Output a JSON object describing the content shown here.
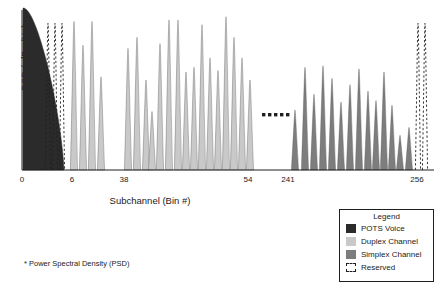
{
  "chart_data": {
    "type": "bar",
    "title": "",
    "xlabel": "Subchannel (Bin #)",
    "ylabel": "PSD ( dBm/Hz)",
    "footnote": "* Power Spectral Density (PSD)",
    "xlim": [
      0,
      270
    ],
    "ylim": [
      0,
      100
    ],
    "grid": false,
    "axis_ticks": [
      {
        "value": 0,
        "label": "0",
        "x": 22
      },
      {
        "value": 6,
        "label": "6",
        "x": 72
      },
      {
        "value": 38,
        "label": "38",
        "x": 124
      },
      {
        "value": 54,
        "label": "54",
        "x": 248
      },
      {
        "value": 241,
        "label": "241",
        "x": 288
      },
      {
        "value": 256,
        "label": "256",
        "x": 417
      }
    ],
    "break_marker": {
      "label": "......",
      "dots": 5,
      "x": 262,
      "y": 113
    },
    "series": [
      {
        "name": "POTS Voice",
        "color": "#2b2b2b",
        "type": "envelope",
        "x_start": 23,
        "x_end": 64,
        "peak_height": 100,
        "description": "Solid dark envelope decaying from left edge"
      },
      {
        "name": "Reserved (low band)",
        "color": "#ffffff",
        "edge": "#1f1f1f",
        "type": "dashed-peaks",
        "peaks": [
          {
            "x": 48,
            "height": 93
          },
          {
            "x": 55,
            "height": 93
          },
          {
            "x": 62,
            "height": 93
          }
        ]
      },
      {
        "name": "Duplex Channel",
        "color": "#c9c9c9",
        "type": "peaks",
        "peaks": [
          {
            "x": 74,
            "height": 94
          },
          {
            "x": 83,
            "height": 79
          },
          {
            "x": 92,
            "height": 94
          },
          {
            "x": 101,
            "height": 59
          },
          {
            "x": 128,
            "height": 77
          },
          {
            "x": 137,
            "height": 84
          },
          {
            "x": 146,
            "height": 57
          },
          {
            "x": 152,
            "height": 37
          },
          {
            "x": 160,
            "height": 80
          },
          {
            "x": 169,
            "height": 95
          },
          {
            "x": 178,
            "height": 95
          },
          {
            "x": 186,
            "height": 62
          },
          {
            "x": 194,
            "height": 65
          },
          {
            "x": 202,
            "height": 92
          },
          {
            "x": 210,
            "height": 71
          },
          {
            "x": 218,
            "height": 63
          },
          {
            "x": 226,
            "height": 97
          },
          {
            "x": 234,
            "height": 84
          },
          {
            "x": 242,
            "height": 71
          },
          {
            "x": 250,
            "height": 57
          }
        ]
      },
      {
        "name": "Simplex Channel",
        "color": "#7d7d7d",
        "type": "peaks",
        "peaks": [
          {
            "x": 295,
            "height": 38
          },
          {
            "x": 305,
            "height": 65
          },
          {
            "x": 314,
            "height": 48
          },
          {
            "x": 323,
            "height": 66
          },
          {
            "x": 332,
            "height": 58
          },
          {
            "x": 341,
            "height": 43
          },
          {
            "x": 350,
            "height": 54
          },
          {
            "x": 359,
            "height": 64
          },
          {
            "x": 368,
            "height": 50
          },
          {
            "x": 376,
            "height": 44
          },
          {
            "x": 384,
            "height": 62
          },
          {
            "x": 392,
            "height": 41
          },
          {
            "x": 400,
            "height": 22
          },
          {
            "x": 409,
            "height": 27
          }
        ]
      },
      {
        "name": "Reserved (high band)",
        "color": "#ffffff",
        "edge": "#1f1f1f",
        "type": "dashed-peaks",
        "peaks": [
          {
            "x": 418,
            "height": 93
          },
          {
            "x": 425,
            "height": 93
          }
        ]
      }
    ]
  },
  "legend": {
    "title": "Legend",
    "items": [
      {
        "label": "POTS Voice",
        "color": "#2b2b2b",
        "style": "solid"
      },
      {
        "label": "Duplex Channel",
        "color": "#c9c9c9",
        "style": "solid"
      },
      {
        "label": "Simplex Channel",
        "color": "#7d7d7d",
        "style": "solid"
      },
      {
        "label": "Reserved",
        "color": "#ffffff",
        "style": "dashed"
      }
    ]
  }
}
